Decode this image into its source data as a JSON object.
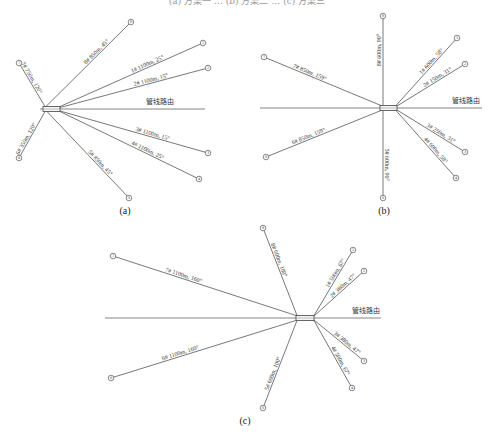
{
  "header": {
    "text": "(a) 方案一 … (b) 方案二 … (c) 方案三"
  },
  "route_label": "管线路由",
  "panels": [
    {
      "id": "a",
      "caption": "(a)",
      "center": [
        50,
        109
      ],
      "route": {
        "x1": 40,
        "x2": 205,
        "y": 109
      },
      "route_label_pos": [
        146,
        104
      ],
      "box": {
        "x": 43,
        "y": 106.5,
        "w": 17,
        "h": 5
      },
      "branches": [
        {
          "id": "8#",
          "label": "8# 850m, 45°",
          "end": [
            131,
            22
          ],
          "start": [
            46,
            106.5
          ]
        },
        {
          "id": "1#",
          "label": "1# 1100m, 25°",
          "end": [
            203,
            43
          ],
          "start": [
            60,
            106.5
          ]
        },
        {
          "id": "2#",
          "label": "2# 1100m, 15°",
          "end": [
            208,
            68
          ],
          "start": [
            60,
            107.5
          ]
        },
        {
          "id": "7#",
          "label": "7# 750m, 120°",
          "end": [
            19,
            63
          ],
          "start": [
            45,
            106.5
          ]
        },
        {
          "id": "6#",
          "label": "6# 350m, 120°",
          "end": [
            19,
            158
          ],
          "start": [
            45,
            111.5
          ]
        },
        {
          "id": "3#",
          "label": "3# 1100m, 15°",
          "end": [
            208,
            153
          ],
          "start": [
            60,
            111
          ]
        },
        {
          "id": "4#",
          "label": "4# 1100m, 25°",
          "end": [
            199,
            179
          ],
          "start": [
            60,
            111.5
          ]
        },
        {
          "id": "5#",
          "label": "5# 850m, 45°",
          "end": [
            129,
            198
          ],
          "start": [
            47,
            111.5
          ]
        }
      ]
    },
    {
      "id": "b",
      "caption": "(b)",
      "center": [
        388,
        108
      ],
      "route": {
        "x1": 260,
        "x2": 482,
        "y": 108
      },
      "route_label_pos": [
        452,
        103
      ],
      "box": {
        "x": 380,
        "y": 105.5,
        "w": 17,
        "h": 5
      },
      "branches": [
        {
          "id": "8#",
          "label": "8# 600m, 90°",
          "end": [
            383,
            16
          ],
          "start": [
            383,
            105.5
          ]
        },
        {
          "id": "1#",
          "label": "1# 600m, 58°",
          "end": [
            457,
            38
          ],
          "start": [
            396,
            105.5
          ]
        },
        {
          "id": "2#",
          "label": "2# 150m, 31°",
          "end": [
            465,
            64
          ],
          "start": [
            397,
            106
          ]
        },
        {
          "id": "7#",
          "label": "7# 850m, 159°",
          "end": [
            264,
            57
          ],
          "start": [
            381,
            105.5
          ]
        },
        {
          "id": "6#",
          "label": "6# 850m, 159°",
          "end": [
            266,
            157
          ],
          "start": [
            381,
            110.5
          ]
        },
        {
          "id": "5#",
          "label": "5# 600m, 90°",
          "end": [
            383,
            198
          ],
          "start": [
            383,
            110.5
          ]
        },
        {
          "id": "3#",
          "label": "3# 250m, 31°",
          "end": [
            465,
            152
          ],
          "start": [
            397,
            110
          ]
        },
        {
          "id": "4#",
          "label": "4# 600m, 58°",
          "end": [
            456,
            178
          ],
          "start": [
            396,
            110.5
          ]
        }
      ]
    },
    {
      "id": "c",
      "caption": "(c)",
      "center": [
        305,
        318
      ],
      "route": {
        "x1": 105,
        "x2": 381,
        "y": 318
      },
      "route_label_pos": [
        352,
        313
      ],
      "box": {
        "x": 296,
        "y": 315.5,
        "w": 18,
        "h": 5
      },
      "branches": [
        {
          "id": "8#",
          "label": "8# 600m, 100°",
          "end": [
            263,
            228
          ],
          "start": [
            297,
            315.5
          ]
        },
        {
          "id": "1#",
          "label": "1# 500m, 67°",
          "end": [
            353,
            250
          ],
          "start": [
            314,
            315.5
          ]
        },
        {
          "id": "2#",
          "label": "2# 380m, 47°",
          "end": [
            364,
            271
          ],
          "start": [
            314,
            316
          ]
        },
        {
          "id": "7#",
          "label": "7# 1100m, 160°",
          "end": [
            113,
            256
          ],
          "start": [
            296,
            315.5
          ]
        },
        {
          "id": "6#",
          "label": "6# 1100m, 160°",
          "end": [
            111,
            378
          ],
          "start": [
            296,
            320.5
          ]
        },
        {
          "id": "5#",
          "label": "5# 600m, 100°",
          "end": [
            263,
            408
          ],
          "start": [
            297,
            320.5
          ]
        },
        {
          "id": "3#",
          "label": "3# 380m, 47°",
          "end": [
            364,
            361
          ],
          "start": [
            314,
            320
          ]
        },
        {
          "id": "4#",
          "label": "4# 500m, 67°",
          "end": [
            352,
            388
          ],
          "start": [
            314,
            320.5
          ]
        }
      ]
    }
  ],
  "captions": {
    "a": "(a)",
    "b": "(b)",
    "c": "(c)"
  }
}
